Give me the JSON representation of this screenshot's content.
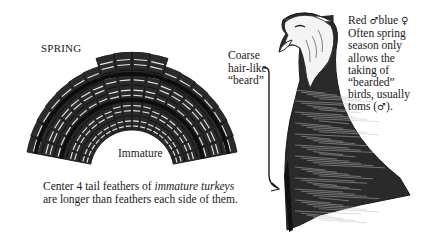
{
  "figure": {
    "season_label": "SPRING",
    "tail_label": "Immature",
    "beard_label_lines": [
      "Coarse",
      "hair-like",
      "“beard”"
    ],
    "right_note": {
      "line1_a": "Red ",
      "male_symbol": "♂",
      "line1_b": "blue ",
      "female_symbol": "♀",
      "lines": [
        "Often spring",
        "season only",
        "allows the",
        "taking of",
        "“bearded”",
        "birds, usually"
      ],
      "last_a": "toms (",
      "last_symbol": "♂",
      "last_b": ")."
    },
    "caption": {
      "line1_plain": "Center 4 tail feathers of ",
      "line1_italic": "immature turkeys",
      "line2": "are longer than feathers each side of them."
    },
    "illustrations": [
      {
        "name": "turkey-tail-fan",
        "description": "immature turkey tail fan"
      },
      {
        "name": "turkey-head-neck",
        "description": "turkey head and neck with beard"
      }
    ],
    "colors": {
      "ink": "#1a1a1a",
      "paper": "#ffffff"
    }
  }
}
